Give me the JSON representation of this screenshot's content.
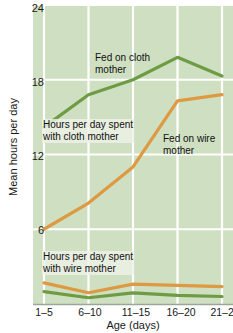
{
  "chart_data": {
    "type": "line",
    "title": "",
    "xlabel": "Age (days)",
    "ylabel": "Mean hours per day",
    "categories": [
      "1–5",
      "6–10",
      "11–15",
      "16–20",
      "21–25"
    ],
    "ylim": [
      0,
      24
    ],
    "yticks": [
      6,
      12,
      18,
      24
    ],
    "ytick_labels": [
      "6",
      "12",
      "18",
      "24"
    ],
    "grid": true,
    "grid_color": "#ffffff",
    "plot_background": "#cfdfc1",
    "legend": "annotations-on-plot",
    "series": [
      {
        "name": "Fed on cloth mother",
        "color": "#6e9c45",
        "values": [
          14.2,
          16.8,
          18.0,
          19.8,
          18.3
        ]
      },
      {
        "name": "Fed on wire mother",
        "color": "#dd9a42",
        "values": [
          6.0,
          8.1,
          11.0,
          16.3,
          16.8
        ]
      },
      {
        "name": "Hours per day spent with wire mother",
        "color": "#dd9a42",
        "values": [
          1.7,
          0.9,
          1.6,
          1.5,
          1.4
        ]
      },
      {
        "name": "Hours per day spent with cloth mother",
        "color": "#6e9c45",
        "values": [
          1.0,
          0.5,
          0.9,
          0.7,
          0.6
        ]
      }
    ],
    "annotations": [
      {
        "text_line1": "Fed on cloth",
        "text_line2": "mother",
        "series": "Fed on cloth mother"
      },
      {
        "text_line1": "Hours per day spent",
        "text_line2": "with cloth mother",
        "series": "Hours per day spent with cloth mother"
      },
      {
        "text_line1": "Fed on wire",
        "text_line2": "mother",
        "series": "Fed on wire mother"
      },
      {
        "text_line1": "Hours per day spent",
        "text_line2": "with wire mother",
        "series": "Hours per day spent with wire mother"
      }
    ]
  },
  "axes": {
    "ytick_0": "24",
    "ytick_1": "18",
    "ytick_2": "12",
    "ytick_3": "6",
    "xtick_0": "1–5",
    "xtick_1": "6–10",
    "xtick_2": "11–15",
    "xtick_3": "16–20",
    "xtick_4": "21–25",
    "ytitle": "Mean hours per day",
    "xtitle": "Age (days)"
  },
  "annotations": {
    "fed_cloth_l1": "Fed on cloth",
    "fed_cloth_l2": "mother",
    "with_cloth_l1": "Hours per day spent",
    "with_cloth_l2": "with cloth mother",
    "fed_wire_l1": "Fed on wire",
    "fed_wire_l2": "mother",
    "with_wire_l1": "Hours per day spent",
    "with_wire_l2": "with wire mother"
  }
}
